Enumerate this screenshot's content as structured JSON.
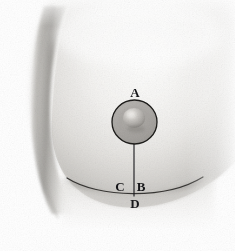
{
  "figure": {
    "type": "grayscale-anatomical-illustration",
    "width": 235,
    "height": 251,
    "background_color": "#ffffff",
    "ink_color": "#17171a",
    "skin_tone_light": "#f2f1ef",
    "skin_tone_mid": "#d8d6d3",
    "skin_tone_shadow": "#9a9894",
    "areola_tone": "#9b9894",
    "nipple_highlight": "#e4e2de"
  },
  "labels": [
    {
      "id": "A",
      "text": "A",
      "meaning": "superior areolar margin"
    },
    {
      "id": "B",
      "text": "B",
      "meaning": "nipple to inframammary fold"
    },
    {
      "id": "C",
      "text": "C",
      "meaning": "inframammary fold point"
    },
    {
      "id": "D",
      "text": "D",
      "meaning": "below inframammary fold"
    }
  ],
  "annotations": {
    "areola_outline": "circle",
    "meridian_line": "vertical line from areola to point D",
    "inframammary_fold": "curved line across lower breast"
  }
}
